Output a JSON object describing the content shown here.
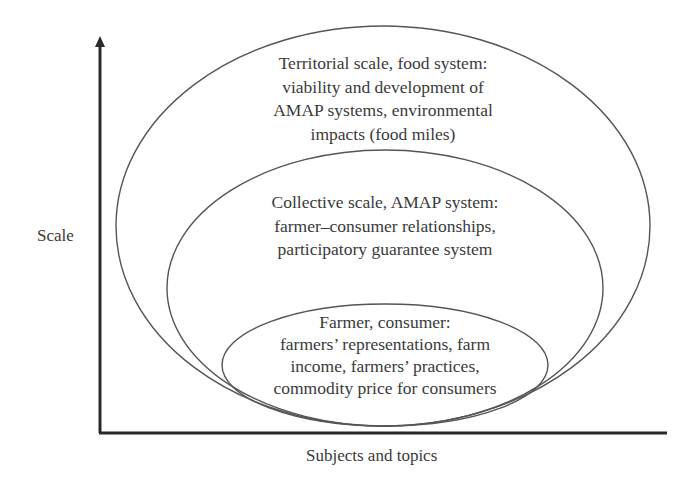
{
  "diagram": {
    "axes": {
      "y_label": "Scale",
      "x_label": "Subjects and topics",
      "y_arrow": true,
      "x_arrow": false
    },
    "ellipses": [
      {
        "id": "territorial",
        "level": "outer",
        "lines": [
          "Territorial scale, food system:",
          "viability and development of",
          "AMAP systems, environmental",
          "impacts (food miles)"
        ]
      },
      {
        "id": "collective",
        "level": "middle",
        "lines": [
          "Collective scale, AMAP system:",
          "farmer–consumer relationships,",
          "participatory guarantee system"
        ]
      },
      {
        "id": "individual",
        "level": "inner",
        "lines": [
          "Farmer, consumer:",
          "farmers’ representations, farm",
          "income, farmers’ practices,",
          "commodity price for consumers"
        ]
      }
    ],
    "colors": {
      "axis": "#2a2a2a",
      "ellipse_stroke": "#555555",
      "text": "#3a3a3a",
      "background": "#ffffff"
    }
  }
}
